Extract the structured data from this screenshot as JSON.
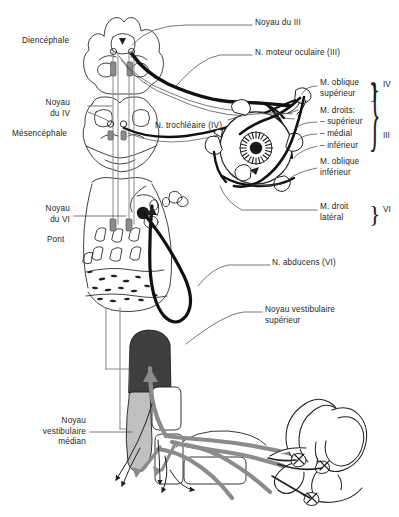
{
  "figure": {
    "title_hidden": "",
    "language": "fr",
    "domain": "neuroanatomy-diagram",
    "canvas": {
      "width": 399,
      "height": 517,
      "background": "#ffffff"
    }
  },
  "colors": {
    "ink": "#231f20",
    "outline": "#231f20",
    "nerve_dark": "#111111",
    "nucleus_dark": "#3f3f3f",
    "nucleus_mid": "#9a9a9a",
    "nucleus_light": "#c9c9c9",
    "tract_gray": "#808080",
    "leader": "#4a4a4a",
    "white": "#ffffff"
  },
  "labels": {
    "left": [
      {
        "id": "diencephale",
        "text": "Diencéphale",
        "x": 22,
        "y": 41,
        "align": "left"
      },
      {
        "id": "noyau-du-iv",
        "text": "Noyau\ndu IV",
        "x": 18,
        "y": 103,
        "align": "right",
        "w": 52
      },
      {
        "id": "mesencephale",
        "text": "Mésencéphale",
        "x": 12,
        "y": 134,
        "align": "left"
      },
      {
        "id": "noyau-du-vi",
        "text": "Noyau\ndu VI",
        "x": 20,
        "y": 208,
        "align": "right",
        "w": 50
      },
      {
        "id": "pont",
        "text": "Pont",
        "x": 47,
        "y": 239,
        "align": "left"
      },
      {
        "id": "noyau-vestibulaire-median",
        "text": "Noyau\nvestibulaire\nmédian",
        "x": 8,
        "y": 420,
        "align": "right",
        "w": 76
      }
    ],
    "inner": [
      {
        "id": "n-trochleaire",
        "text": "N. trochléaire (IV)",
        "x": 155,
        "y": 126,
        "align": "left"
      }
    ],
    "right": [
      {
        "id": "noyau-du-iii",
        "text": "Noyau du III",
        "x": 255,
        "y": 22,
        "align": "left"
      },
      {
        "id": "n-moteur-oculaire",
        "text": "N. moteur oculaire (III)",
        "x": 255,
        "y": 52,
        "align": "left"
      },
      {
        "id": "m-oblique-superieur",
        "text": "M. oblique\nsupérieur",
        "x": 320,
        "y": 82,
        "align": "left"
      },
      {
        "id": "m-droits",
        "text": "M. droits:",
        "x": 320,
        "y": 110,
        "align": "left"
      },
      {
        "id": "m-droit-superieur",
        "text": "– supérieur",
        "x": 320,
        "y": 121,
        "align": "left"
      },
      {
        "id": "m-droit-medial",
        "text": "– médial",
        "x": 320,
        "y": 133,
        "align": "left"
      },
      {
        "id": "m-droit-inferieur",
        "text": "– inférieur",
        "x": 320,
        "y": 145,
        "align": "left"
      },
      {
        "id": "m-oblique-inferieur",
        "text": "M. oblique\ninférieur",
        "x": 320,
        "y": 161,
        "align": "left"
      },
      {
        "id": "m-droit-lateral",
        "text": "M. droit\nlatéral",
        "x": 320,
        "y": 206,
        "align": "left"
      },
      {
        "id": "n-abducens",
        "text": "N. abducens (VI)",
        "x": 272,
        "y": 262,
        "align": "left"
      },
      {
        "id": "noyau-vestibulaire-superieur",
        "text": "Noyau vestibulaire\nsupérieur",
        "x": 265,
        "y": 309,
        "align": "left"
      }
    ],
    "roman_numerals": [
      {
        "id": "brace-iv",
        "text": "IV",
        "x": 383,
        "y": 82,
        "brace_top": 78,
        "brace_height": 22
      },
      {
        "id": "brace-iii",
        "text": "III",
        "x": 383,
        "y": 133,
        "brace_top": 104,
        "brace_height": 78
      },
      {
        "id": "brace-vi",
        "text": "VI",
        "x": 383,
        "y": 207,
        "brace_top": 202,
        "brace_height": 22
      }
    ]
  }
}
